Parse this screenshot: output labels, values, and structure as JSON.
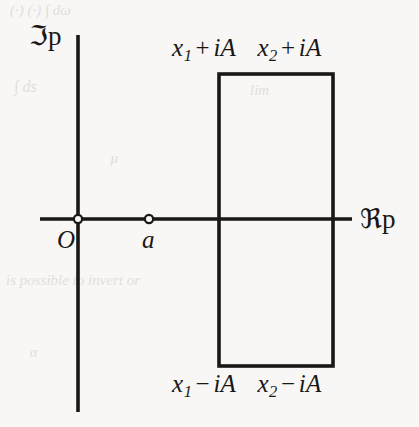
{
  "figure": {
    "background_color": "#f8f7f5",
    "ink_color": "#1a1715"
  },
  "axes": {
    "imaginary": {
      "label_prefix": "ℑ",
      "label_variable": "p",
      "name": "imaginary-axis",
      "x": 78,
      "y_start": 35,
      "y_end": 412
    },
    "real": {
      "label_prefix": "ℜ",
      "label_variable": "p",
      "name": "real-axis",
      "y": 219,
      "x_start": 40,
      "x_end": 352
    }
  },
  "points": [
    {
      "id": "origin",
      "label": "O",
      "x": 78,
      "y": 219,
      "marker": "open-circle"
    },
    {
      "id": "a",
      "label": "a",
      "x": 149,
      "y": 219,
      "marker": "open-circle"
    }
  ],
  "contour": {
    "shape": "rectangle",
    "left": 219,
    "right": 333,
    "top": 74,
    "bottom": 366,
    "stroke_width": 3.5,
    "stroke_color": "#1a1715",
    "fill": "none"
  },
  "corner_labels": {
    "top": {
      "left": {
        "base": "x",
        "sub": "1",
        "op": "+",
        "imag": "iA"
      },
      "right": {
        "base": "x",
        "sub": "2",
        "op": "+",
        "imag": "iA"
      }
    },
    "bottom": {
      "left": {
        "base": "x",
        "sub": "1",
        "op": "−",
        "imag": "iA"
      },
      "right": {
        "base": "x",
        "sub": "2",
        "op": "−",
        "imag": "iA"
      }
    }
  },
  "bleed_through": [
    {
      "text": "(·)  (·)   ∫  dω",
      "x": 10,
      "y": 2,
      "size": 15,
      "rotate": 0
    },
    {
      "text": "∫ ds",
      "x": 14,
      "y": 78,
      "size": 16,
      "rotate": 0
    },
    {
      "text": "lim",
      "x": 250,
      "y": 82,
      "size": 15,
      "rotate": 0
    },
    {
      "text": "µ",
      "x": 110,
      "y": 150,
      "size": 15,
      "rotate": 0
    },
    {
      "text": "is possible to invert or",
      "x": 6,
      "y": 272,
      "size": 15,
      "rotate": 0
    },
    {
      "text": "α",
      "x": 30,
      "y": 345,
      "size": 14,
      "rotate": 0
    }
  ]
}
